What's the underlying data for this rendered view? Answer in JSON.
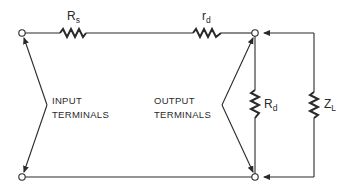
{
  "diagram": {
    "type": "circuit-schematic",
    "components": {
      "source_resistor": {
        "symbol": "R",
        "subscript": "s"
      },
      "series_resistor": {
        "symbol": "r",
        "subscript": "d"
      },
      "shunt_resistor": {
        "symbol": "R",
        "subscript": "d"
      },
      "load_impedance": {
        "symbol": "Z",
        "subscript": "L"
      }
    },
    "labels": {
      "input_line1": "INPUT",
      "input_line2": "TERMINALS",
      "output_line1": "OUTPUT",
      "output_line2": "TERMINALS"
    },
    "colors": {
      "line": "#2a2a2a",
      "background": "#ffffff"
    }
  }
}
